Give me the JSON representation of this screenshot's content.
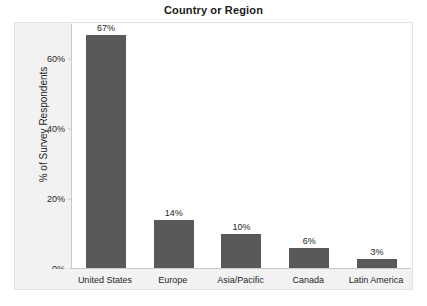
{
  "chart_data": {
    "type": "bar",
    "title": "Country or Region",
    "xlabel": "",
    "ylabel": "% of Survey Respondents",
    "categories": [
      "United States",
      "Europe",
      "Asia/Pacific",
      "Canada",
      "Latin America"
    ],
    "values": [
      67,
      14,
      10,
      6,
      3
    ],
    "value_labels": [
      "67%",
      "14%",
      "10%",
      "6%",
      "3%"
    ],
    "ylim": [
      0,
      70
    ],
    "y_ticks": [
      0,
      20,
      40,
      60
    ],
    "y_tick_labels": [
      "0%",
      "20%",
      "40%",
      "60%"
    ],
    "grid": false,
    "legend": false,
    "legend_position": "none",
    "colors": {
      "bar": "#595959",
      "plot_background": "#ffffff",
      "chart_background": "#f2f2f2",
      "axis_line": "#c8c8c8",
      "frame_border": "#e2e2e2",
      "text": "#262626",
      "title_text": "#1a1a1a"
    }
  }
}
